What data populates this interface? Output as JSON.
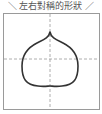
{
  "title": "＼ 左右對稱的形狀 ／",
  "figure": {
    "guides": {
      "vertical_axis": "dashed",
      "horizontal_axis": "dashed"
    },
    "colors": {
      "outline": "#333333",
      "guide": "#999999",
      "frame": "#9a9a9a"
    }
  }
}
